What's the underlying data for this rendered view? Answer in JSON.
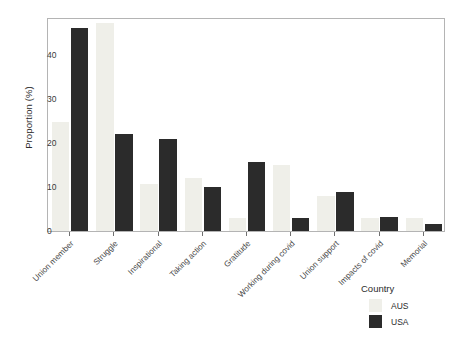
{
  "chart_data": {
    "type": "bar",
    "title": "",
    "xlabel": "",
    "ylabel": "Proportion (%)",
    "ylim": [
      0,
      48
    ],
    "yticks": [
      0,
      10,
      20,
      30,
      40
    ],
    "grid": false,
    "legend_position": "bottom-right",
    "categories": [
      "Union member",
      "Struggle",
      "Inspirational",
      "Taking action",
      "Gratitude",
      "Working during covid",
      "Union support",
      "Impacts of covid",
      "Memorial"
    ],
    "series": [
      {
        "name": "AUS",
        "color": "#efefe9",
        "values": [
          24.8,
          47.3,
          10.7,
          12.0,
          3.0,
          15.0,
          8.0,
          3.0,
          3.0
        ]
      },
      {
        "name": "USA",
        "color": "#2b2b2b",
        "values": [
          46.1,
          22.0,
          20.9,
          10.0,
          15.6,
          3.0,
          8.9,
          3.2,
          1.7
        ]
      }
    ]
  },
  "legend": {
    "title": "Country",
    "entries": [
      {
        "label": "AUS",
        "color": "#efefe9"
      },
      {
        "label": "USA",
        "color": "#2b2b2b"
      }
    ]
  },
  "axes": {
    "y_title": "Proportion (%)",
    "y_tick_labels": [
      "0",
      "10",
      "20",
      "30",
      "40"
    ]
  }
}
